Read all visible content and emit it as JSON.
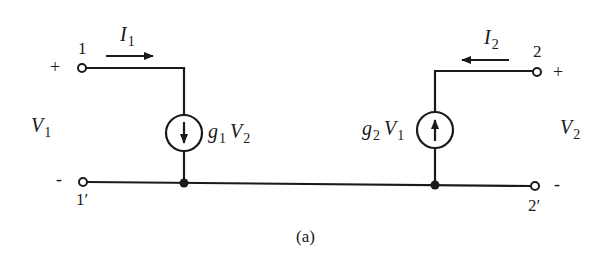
{
  "diagram": {
    "caption": "(a)",
    "terminals": {
      "t1": "1",
      "t1p": "1′",
      "t2": "2",
      "t2p": "2′"
    },
    "signs": {
      "left_plus": "+",
      "left_minus": "-",
      "right_plus": "+",
      "right_minus": "-"
    },
    "currents": {
      "i1": {
        "symbol": "I",
        "sub": "1",
        "direction": "right"
      },
      "i2": {
        "symbol": "I",
        "sub": "2",
        "direction": "left"
      }
    },
    "voltages": {
      "v1": {
        "symbol": "V",
        "sub": "1"
      },
      "v2": {
        "symbol": "V",
        "sub": "2"
      }
    },
    "sources": {
      "left": {
        "g": "g",
        "g_sub": "1",
        "v": "V",
        "v_sub": "2",
        "arrow": "down"
      },
      "right": {
        "g": "g",
        "g_sub": "2",
        "v": "V",
        "v_sub": "1",
        "arrow": "up"
      }
    },
    "colors": {
      "ink": "#1a1a1a",
      "background": "#ffffff"
    }
  }
}
